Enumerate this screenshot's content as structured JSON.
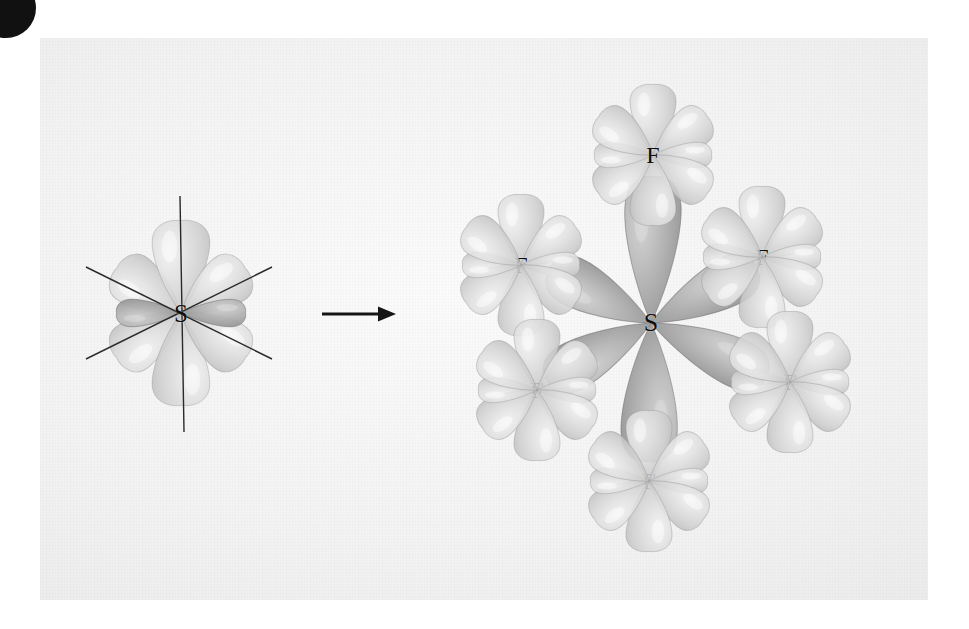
{
  "figure": {
    "kind": "chemistry-orbital-diagram",
    "background_color": "#f3f3f3",
    "page_background": "#ffffff",
    "lobe_color_light": "#dcdcdc",
    "lobe_color_dark": "#9a9a9a",
    "label_color": "#0d0d0d",
    "arrow_color": "#151515"
  },
  "corner_bullet": {
    "name": "page-corner-bullet",
    "color": "#111111"
  },
  "arrow": {
    "label": "forms",
    "glyph": "→",
    "x1": 322,
    "y1": 314,
    "x2": 396,
    "y2": 314
  },
  "left_structure": {
    "name": "sp3d2-hybrid-orbital-set",
    "center": {
      "x": 181,
      "y": 313
    },
    "center_label": "S",
    "lobe_count": 6,
    "lobes": [
      {
        "name": "lobe-up",
        "angle": -90,
        "length": 96,
        "width": 62,
        "shade": "light"
      },
      {
        "name": "lobe-down",
        "angle": 90,
        "length": 96,
        "width": 62,
        "shade": "light"
      },
      {
        "name": "lobe-upper-left",
        "angle": -145,
        "length": 82,
        "width": 56,
        "shade": "light"
      },
      {
        "name": "lobe-upper-right",
        "angle": -35,
        "length": 82,
        "width": 56,
        "shade": "light"
      },
      {
        "name": "lobe-lower-left",
        "angle": 145,
        "length": 82,
        "width": 56,
        "shade": "light"
      },
      {
        "name": "lobe-lower-right",
        "angle": 35,
        "length": 82,
        "width": 56,
        "shade": "light"
      },
      {
        "name": "lobe-toward-left",
        "angle": 180,
        "length": 68,
        "width": 30,
        "shade": "dark"
      },
      {
        "name": "lobe-toward-right",
        "angle": 0,
        "length": 68,
        "width": 30,
        "shade": "dark"
      }
    ],
    "axes": [
      {
        "name": "axis-vertical",
        "x1": 180,
        "y1": 196,
        "x2": 184,
        "y2": 432
      },
      {
        "name": "axis-diagonal-nw",
        "x1": 86,
        "y1": 267,
        "x2": 272,
        "y2": 359
      },
      {
        "name": "axis-diagonal-sw",
        "x1": 86,
        "y1": 359,
        "x2": 272,
        "y2": 267
      }
    ]
  },
  "right_structure": {
    "name": "sf6-molecule",
    "formula": "SF6",
    "sulfur": {
      "label": "S",
      "x": 651,
      "y": 323
    },
    "fluorines": [
      {
        "label": "F",
        "name": "fluorine-top",
        "x": 653,
        "y": 155
      },
      {
        "label": "F",
        "name": "fluorine-upper-left",
        "x": 521,
        "y": 265
      },
      {
        "label": "F",
        "name": "fluorine-upper-right",
        "x": 762,
        "y": 257
      },
      {
        "label": "F",
        "name": "fluorine-lower-left",
        "x": 537,
        "y": 390
      },
      {
        "label": "F",
        "name": "fluorine-lower-right",
        "x": 790,
        "y": 382
      },
      {
        "label": "F",
        "name": "fluorine-bottom",
        "x": 649,
        "y": 481
      }
    ],
    "sulfur_lobes": [
      {
        "name": "s-lobe-to-top",
        "angle": -89,
        "length": 150,
        "width": 60,
        "shade": "dark"
      },
      {
        "name": "s-lobe-to-bottom",
        "angle": 91,
        "length": 142,
        "width": 60,
        "shade": "dark"
      },
      {
        "name": "s-lobe-to-upper-left",
        "angle": -152,
        "length": 118,
        "width": 52,
        "shade": "dark"
      },
      {
        "name": "s-lobe-to-upper-right",
        "angle": -28,
        "length": 122,
        "width": 52,
        "shade": "dark"
      },
      {
        "name": "s-lobe-to-lower-left",
        "angle": 151,
        "length": 122,
        "width": 52,
        "shade": "dark"
      },
      {
        "name": "s-lobe-to-lower-right",
        "angle": 25,
        "length": 130,
        "width": 52,
        "shade": "dark"
      }
    ],
    "fluorine_lobe_pattern": [
      {
        "name": "f-lobe-n",
        "angle": -90,
        "length": 74,
        "width": 50
      },
      {
        "name": "f-lobe-ne",
        "angle": -35,
        "length": 70,
        "width": 46
      },
      {
        "name": "f-lobe-e",
        "angle": 0,
        "length": 62,
        "width": 28
      },
      {
        "name": "f-lobe-se",
        "angle": 35,
        "length": 70,
        "width": 46
      },
      {
        "name": "f-lobe-s",
        "angle": 90,
        "length": 74,
        "width": 50
      },
      {
        "name": "f-lobe-sw",
        "angle": 145,
        "length": 70,
        "width": 46
      },
      {
        "name": "f-lobe-w",
        "angle": 180,
        "length": 62,
        "width": 28
      },
      {
        "name": "f-lobe-nw",
        "angle": -145,
        "length": 70,
        "width": 46
      }
    ]
  }
}
